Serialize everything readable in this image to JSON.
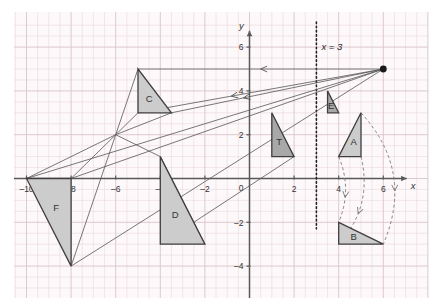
{
  "figure": {
    "background": "#ffffff",
    "grid_minor_color": "#ead9dd",
    "grid_major_color": "#d9c4ca",
    "axis_color": "#595959",
    "shape_stroke": "#3f3f3f",
    "shape_fill_light": "#cccccc",
    "shape_fill_dark": "#a8a8a8",
    "mapping_line_color": "#555555",
    "arc_color": "#777777"
  },
  "axes": {
    "x_axis_label": "x",
    "y_axis_label": "y",
    "x_ticks": [
      {
        "value": -10,
        "label": "–10"
      },
      {
        "value": -8,
        "label": "–8"
      },
      {
        "value": -6,
        "label": "–6"
      },
      {
        "value": -4,
        "label": "–4"
      },
      {
        "value": -2,
        "label": "–2"
      },
      {
        "value": 2,
        "label": "2"
      },
      {
        "value": 4,
        "label": "4"
      },
      {
        "value": 6,
        "label": "6"
      }
    ],
    "y_ticks": [
      {
        "value": 6,
        "label": "6"
      },
      {
        "value": 4,
        "label": "4"
      },
      {
        "value": 2,
        "label": "2"
      },
      {
        "value": -2,
        "label": "–2"
      },
      {
        "value": -4,
        "label": "–4"
      }
    ],
    "origin_label": "0",
    "x_range": [
      -11.2,
      7.2
    ],
    "y_range": [
      -4.8,
      7.0
    ]
  },
  "mirror_line": {
    "label": "x = 3",
    "x_value": 3,
    "style": "dotted",
    "color": "#222222"
  },
  "centre_of_enlargement": {
    "name": "centre-point",
    "x": 6,
    "y": 5
  },
  "convergence_point": {
    "x": -6,
    "y": 2
  },
  "shapes": [
    {
      "id": "T",
      "label": "T",
      "fill": "dark",
      "points": [
        [
          1,
          3
        ],
        [
          1,
          1
        ],
        [
          2,
          1
        ]
      ]
    },
    {
      "id": "A",
      "label": "A",
      "fill": "light",
      "points": [
        [
          4,
          1
        ],
        [
          5,
          3
        ],
        [
          5,
          1
        ]
      ]
    },
    {
      "id": "B",
      "label": "B",
      "fill": "light",
      "points": [
        [
          4,
          -2
        ],
        [
          6,
          -3
        ],
        [
          4,
          -3
        ]
      ]
    },
    {
      "id": "C",
      "label": "C",
      "fill": "light",
      "points": [
        [
          -5,
          5
        ],
        [
          -5,
          3
        ],
        [
          -3.5,
          3
        ]
      ]
    },
    {
      "id": "D",
      "label": "D",
      "fill": "light",
      "points": [
        [
          -4,
          1
        ],
        [
          -4,
          -3
        ],
        [
          -2,
          -3
        ]
      ]
    },
    {
      "id": "E",
      "label": "E",
      "fill": "dark",
      "points": [
        [
          3.5,
          4
        ],
        [
          3.5,
          3
        ],
        [
          4,
          3
        ]
      ]
    },
    {
      "id": "F",
      "label": "F",
      "fill": "light",
      "points": [
        [
          -10,
          0
        ],
        [
          -8,
          0
        ],
        [
          -8,
          -4
        ]
      ]
    }
  ],
  "mapping_lines": [
    {
      "from": [
        6,
        5
      ],
      "to": [
        -5,
        5
      ],
      "arrow_at": 0.5
    },
    {
      "from": [
        6,
        5
      ],
      "to": [
        -5,
        3
      ],
      "arrow_at": 0.62
    },
    {
      "from": [
        6,
        5
      ],
      "to": [
        -3.5,
        3
      ],
      "arrow_at": 0.66
    },
    {
      "from": [
        6,
        5
      ],
      "to": [
        -10,
        0
      ],
      "arrow_at": 0.0
    },
    {
      "from": [
        6,
        5
      ],
      "to": [
        -8,
        -4
      ],
      "arrow_at": 0.0
    },
    {
      "from": [
        6,
        5
      ],
      "to": [
        -8,
        0
      ],
      "arrow_at": 0.0
    }
  ],
  "ray_lines": [
    {
      "from": [
        -6,
        2
      ],
      "to": [
        -5,
        5
      ]
    },
    {
      "from": [
        -6,
        2
      ],
      "to": [
        -5,
        3
      ]
    },
    {
      "from": [
        -6,
        2
      ],
      "to": [
        -3.5,
        3
      ]
    },
    {
      "from": [
        -6,
        2
      ],
      "to": [
        -10,
        0
      ]
    },
    {
      "from": [
        -6,
        2
      ],
      "to": [
        -8,
        -4
      ]
    },
    {
      "from": [
        -6,
        2
      ],
      "to": [
        -8,
        0
      ]
    },
    {
      "from": [
        -4,
        1
      ],
      "to": [
        -6,
        2
      ]
    },
    {
      "from": [
        -4,
        -3
      ],
      "to": [
        2,
        1
      ]
    },
    {
      "from": [
        -2,
        -3
      ],
      "to": [
        -4,
        1
      ]
    }
  ],
  "rotation_arcs": [
    {
      "from": [
        4,
        1
      ],
      "to": [
        4,
        -2
      ],
      "bulge": 0.55
    },
    {
      "from": [
        5,
        1
      ],
      "to": [
        4,
        -3
      ],
      "bulge": 0.7
    },
    {
      "from": [
        5,
        3
      ],
      "to": [
        6,
        -3
      ],
      "bulge": 0.85
    }
  ]
}
